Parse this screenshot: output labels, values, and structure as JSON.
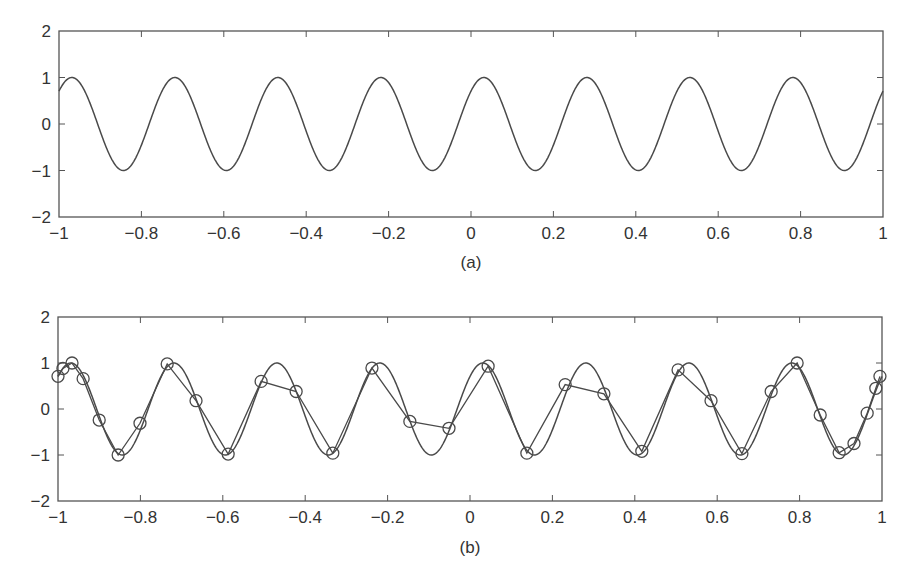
{
  "chart_data": [
    {
      "type": "line",
      "panel_label": "(a)",
      "title": "",
      "xlabel": "",
      "ylabel": "",
      "xlim": [
        -1,
        1
      ],
      "ylim": [
        -2,
        2
      ],
      "xticks": [
        -1,
        -0.8,
        -0.6,
        -0.4,
        -0.2,
        0,
        0.2,
        0.4,
        0.6,
        0.8,
        1
      ],
      "xtick_labels": [
        "−1",
        "−0.8",
        "−0.6",
        "−0.4",
        "−0.2",
        "0",
        "0.2",
        "0.4",
        "0.6",
        "0.8",
        "1"
      ],
      "yticks": [
        -2,
        -1,
        0,
        1,
        2
      ],
      "ytick_labels": [
        "−2",
        "−1",
        "0",
        "1",
        "2"
      ],
      "grid": false,
      "series": [
        {
          "name": "continuous signal",
          "function": "sin(8*pi*x + pi/4)",
          "amplitude": 1,
          "cycles_in_range": 8,
          "style": "solid",
          "marker": "none",
          "color": "#4a4a4a"
        }
      ]
    },
    {
      "type": "line",
      "panel_label": "(b)",
      "title": "",
      "xlabel": "",
      "ylabel": "",
      "xlim": [
        -1,
        1
      ],
      "ylim": [
        -2,
        2
      ],
      "xticks": [
        -1,
        -0.8,
        -0.6,
        -0.4,
        -0.2,
        0,
        0.2,
        0.4,
        0.6,
        0.8,
        1
      ],
      "xtick_labels": [
        "−1",
        "−0.8",
        "−0.6",
        "−0.4",
        "−0.2",
        "0",
        "0.2",
        "0.4",
        "0.6",
        "0.8",
        "1"
      ],
      "yticks": [
        -2,
        -1,
        0,
        1,
        2
      ],
      "ytick_labels": [
        "−2",
        "−1",
        "0",
        "1",
        "2"
      ],
      "grid": false,
      "series": [
        {
          "name": "continuous signal",
          "function": "sin(8*pi*x + pi/4)",
          "style": "solid",
          "marker": "none",
          "color": "#4a4a4a"
        },
        {
          "name": "nonuniform samples",
          "style": "solid",
          "marker": "circle",
          "color": "#4a4a4a",
          "x": [
            -1.0,
            -0.988,
            -0.966,
            -0.939,
            -0.9,
            -0.854,
            -0.801,
            -0.735,
            -0.665,
            -0.587,
            -0.507,
            -0.422,
            -0.333,
            -0.238,
            -0.146,
            -0.051,
            0.044,
            0.138,
            0.231,
            0.325,
            0.417,
            0.505,
            0.585,
            0.66,
            0.731,
            0.794,
            0.85,
            0.896,
            0.932,
            0.964,
            0.985,
            0.995
          ],
          "y": [
            0.71,
            0.88,
            1.0,
            0.66,
            -0.24,
            -1.0,
            -0.31,
            0.98,
            0.18,
            -0.98,
            0.6,
            0.38,
            -0.96,
            0.89,
            -0.27,
            -0.42,
            0.93,
            -0.96,
            0.53,
            0.33,
            -0.92,
            0.85,
            0.18,
            -0.97,
            0.38,
            1.0,
            -0.13,
            -0.95,
            -0.75,
            -0.09,
            0.45,
            0.71
          ]
        }
      ]
    }
  ]
}
